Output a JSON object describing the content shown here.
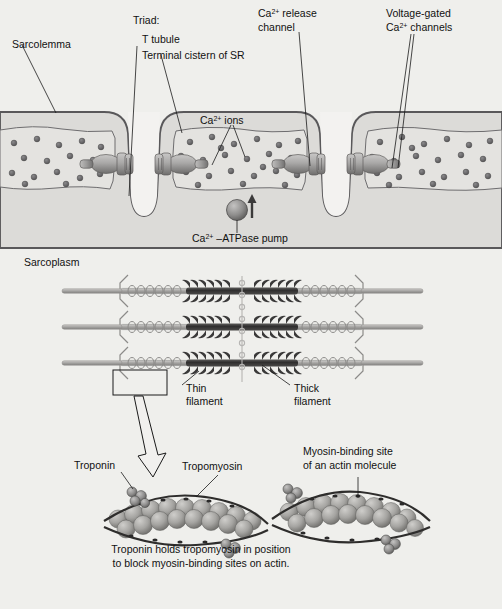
{
  "figure": {
    "background_color": "#efeeec"
  },
  "colors": {
    "page_background": "#efeeec",
    "cytoplasm_fill": "#dcdbd8",
    "membrane_stroke": "#59585a",
    "sr_fill": "#e4e3e0",
    "sr_stroke": "#6e6d6f",
    "calcium_ion": "#6b6a6c",
    "protein_fill": "#a7a6a5",
    "protein_shadow": "#6d6c6b",
    "thick_filament": "#3c3b3b",
    "thin_filament": "#b3b2b0",
    "label_text": "#111111",
    "leader_line": "#1a1a1a"
  },
  "labels": {
    "sarcolemma": "Sarcolemma",
    "triad_header": "Triad:",
    "t_tubule": "T tubule",
    "terminal_cistern": "Terminal cistern of SR",
    "release_channel_line1": "Ca",
    "release_channel_sup": "2+",
    "release_channel_line1_rest": " release",
    "release_channel_line2": "channel",
    "voltage_gated_line1": "Voltage-gated",
    "voltage_gated_line2_pre": "Ca",
    "voltage_gated_line2_sup": "2+",
    "voltage_gated_line2_rest": " channels",
    "calcium_ions_pre": "Ca",
    "calcium_ions_sup": "2+",
    "calcium_ions_rest": " ions",
    "atpase_pre": "Ca",
    "atpase_sup": "2+",
    "atpase_rest": " –ATPase pump",
    "sarcoplasm": "Sarcoplasm",
    "thin_filament_line1": "Thin",
    "thin_filament_line2": "filament",
    "thick_filament_line1": "Thick",
    "thick_filament_line2": "filament",
    "troponin": "Troponin",
    "tropomyosin": "Tropomyosin",
    "myosin_site_line1": "Myosin-binding site",
    "myosin_site_line2": "of an actin molecule",
    "caption_line1": "Troponin holds tropomyosin in position",
    "caption_line2": "to block myosin-binding sites on actin."
  },
  "structures": {
    "t_tubule_count": 2,
    "sr_cistern_count": 4,
    "release_channel_count": 4,
    "atpase_pump_count": 1,
    "myofibril_rows": 3,
    "calcium_ion_count_approx": 86
  }
}
